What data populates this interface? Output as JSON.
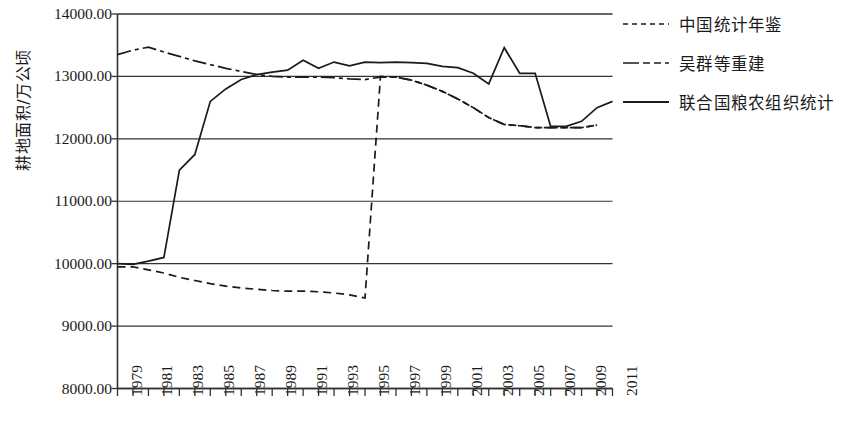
{
  "chart_data": {
    "type": "line",
    "title": "",
    "xlabel": "",
    "ylabel": "耕地面积/万公顷",
    "xlim": [
      1979,
      2011
    ],
    "ylim": [
      8000,
      14000
    ],
    "yticks": [
      "8000.00",
      "9000.00",
      "10000.00",
      "11000.00",
      "12000.00",
      "13000.00",
      "14000.00"
    ],
    "xticks": [
      "1979",
      "1981",
      "1983",
      "1985",
      "1987",
      "1989",
      "1991",
      "1993",
      "1995",
      "1997",
      "1999",
      "2001",
      "2003",
      "2005",
      "2007",
      "2009",
      "2011"
    ],
    "xticks_minor": [
      "1980",
      "1982",
      "1984",
      "1986",
      "1988",
      "1990",
      "1992",
      "1994",
      "1996",
      "1998",
      "2000",
      "2002",
      "2004",
      "2006",
      "2008",
      "2010"
    ],
    "grid": "horizontal",
    "legend_position": "right",
    "x": [
      1979,
      1980,
      1981,
      1982,
      1983,
      1984,
      1985,
      1986,
      1987,
      1988,
      1989,
      1990,
      1991,
      1992,
      1993,
      1994,
      1995,
      1996,
      1997,
      1998,
      1999,
      2000,
      2001,
      2002,
      2003,
      2004,
      2005,
      2006,
      2007,
      2008,
      2009,
      2010,
      2011
    ],
    "series": [
      {
        "name": "中国统计年鉴",
        "style": "dashed",
        "color": "#1a1a1a",
        "values": [
          9950,
          9950,
          9900,
          9850,
          9780,
          9730,
          9680,
          9640,
          9610,
          9590,
          9570,
          9560,
          9560,
          9550,
          9530,
          9500,
          9450,
          13000,
          12990,
          12940,
          12860,
          12760,
          12640,
          12500,
          12340,
          12230,
          12210,
          12180,
          12180,
          12180,
          12180,
          12220,
          null
        ]
      },
      {
        "name": "吴群等重建",
        "style": "dashdot",
        "color": "#1a1a1a",
        "values": [
          13350,
          13420,
          13470,
          13390,
          13320,
          13250,
          13190,
          13130,
          13080,
          13030,
          13000,
          12990,
          12990,
          12990,
          12980,
          12960,
          12950,
          12990,
          12990,
          12940,
          12860,
          12760,
          12640,
          12500,
          12340,
          12230,
          12210,
          12180,
          12180,
          12180,
          12180,
          12220,
          null
        ]
      },
      {
        "name": "联合国粮农组织统计",
        "style": "solid",
        "color": "#1a1a1a",
        "values": [
          10000,
          9990,
          10040,
          10100,
          11500,
          11750,
          12600,
          12800,
          12950,
          13030,
          13070,
          13100,
          13260,
          13130,
          13230,
          13170,
          13230,
          13220,
          13230,
          13220,
          13210,
          13160,
          13140,
          13050,
          12880,
          13460,
          13050,
          13050,
          12200,
          12200,
          12280,
          12500,
          12600
        ]
      }
    ]
  },
  "legend": {
    "items": [
      {
        "label": "中国统计年鉴",
        "style": "dashed"
      },
      {
        "label": "吴群等重建",
        "style": "dashdot"
      },
      {
        "label": "联合国粮农组织统计",
        "style": "solid"
      }
    ]
  }
}
